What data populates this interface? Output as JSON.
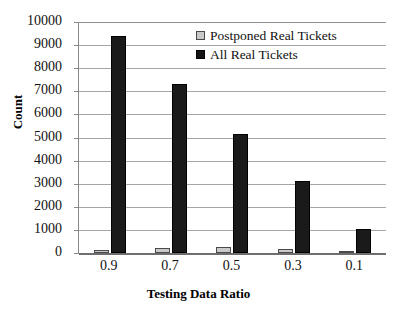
{
  "chart_data": {
    "type": "bar",
    "title": "",
    "xlabel": "Testing Data Ratio",
    "ylabel": "Count",
    "categories": [
      "0.9",
      "0.7",
      "0.5",
      "0.3",
      "0.1"
    ],
    "series": [
      {
        "name": "Postponed Real Tickets",
        "color": "#c9c9c9",
        "values": [
          130,
          230,
          260,
          170,
          60
        ]
      },
      {
        "name": "All Real Tickets",
        "color": "#1a1a1a",
        "values": [
          9400,
          7320,
          5150,
          3100,
          1050
        ]
      }
    ],
    "ylim": [
      0,
      10000
    ],
    "yticks": [
      "0",
      "1000",
      "2000",
      "3000",
      "4000",
      "5000",
      "6000",
      "7000",
      "8000",
      "9000",
      "10000"
    ],
    "ytick_values": [
      0,
      1000,
      2000,
      3000,
      4000,
      5000,
      6000,
      7000,
      8000,
      9000,
      10000
    ],
    "grid": true,
    "legend_position": "top-right-inside"
  },
  "legend": {
    "items": [
      {
        "label": "Postponed Real Tickets",
        "swatch": "light-gray-square"
      },
      {
        "label": "All Real Tickets",
        "swatch": "black-square"
      }
    ]
  }
}
